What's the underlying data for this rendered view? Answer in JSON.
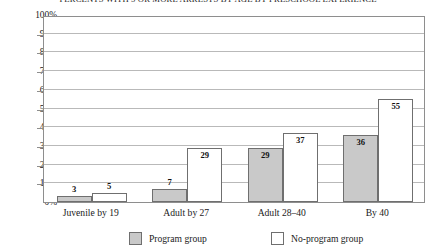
{
  "chart_data": {
    "type": "bar",
    "title": "PERCENTS WITH 5 OR MORE ARRESTS BY AGE BY PRESCHOOL EXPERIENCE",
    "xlabel": "",
    "ylabel": "",
    "ylim": [
      0,
      100
    ],
    "ytick_labels": [
      "100%",
      "90%",
      "80%",
      "70%",
      "60%",
      "50%",
      "40%",
      "30%",
      "20%",
      "10%",
      "0%"
    ],
    "ytick_values": [
      100,
      90,
      80,
      70,
      60,
      50,
      40,
      30,
      20,
      10,
      0
    ],
    "grid": true,
    "legend_position": "bottom",
    "categories": [
      "Juvenile by 19",
      "Adult by 27",
      "Adult 28–40",
      "By 40"
    ],
    "series": [
      {
        "name": "Program group",
        "color": "#c9c9c9",
        "values": [
          3,
          7,
          29,
          36
        ],
        "value_labels": [
          "3",
          "7",
          "29",
          "36"
        ]
      },
      {
        "name": "No-program group",
        "color": "#ffffff",
        "values": [
          5,
          29,
          37,
          55
        ],
        "value_labels": [
          "5",
          "29",
          "37",
          "55"
        ]
      }
    ]
  },
  "legend": {
    "entries": [
      {
        "label": "Program group",
        "swatch": "program"
      },
      {
        "label": "No-program group",
        "swatch": "noprogram"
      }
    ]
  }
}
